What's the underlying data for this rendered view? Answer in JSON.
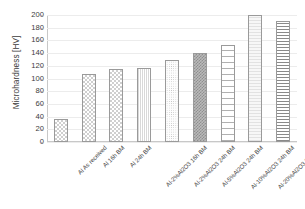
{
  "chart_data": {
    "type": "bar",
    "title": "",
    "xlabel": "",
    "ylabel": "Microhardness [HV]",
    "ylim": [
      0,
      200
    ],
    "ytick_step": 20,
    "grid": true,
    "legend": "none",
    "categories": [
      "Al As received",
      "Al 16h BM",
      "Al 24h BM",
      "Al-2%Al2O3 16h BM",
      "Al-2%Al2O3 24h BM",
      "Al-5%Al2O3 24h BM",
      "Al-10%Al2O3 24h BM",
      "Al-20%Al2O3 24h BM",
      "Al-30%Al2O3 24h BM"
    ],
    "values": [
      36,
      107,
      115,
      117,
      129,
      140,
      153,
      200,
      191
    ],
    "yticks": [
      "0",
      "20",
      "40",
      "60",
      "80",
      "100",
      "120",
      "140",
      "160",
      "180",
      "200"
    ],
    "bar_patterns": [
      "checkerboard",
      "checkerboard",
      "checkerboard",
      "fine-vertical",
      "fine-dot",
      "dense-dark-checker",
      "ladder",
      "light-gray-stripe",
      "horizontal-stripe"
    ],
    "colors": {
      "axis": "#c8c8c8",
      "grid": "#ececec",
      "text": "#3c3c3c",
      "bar_outline": "#9a9a9a"
    }
  }
}
